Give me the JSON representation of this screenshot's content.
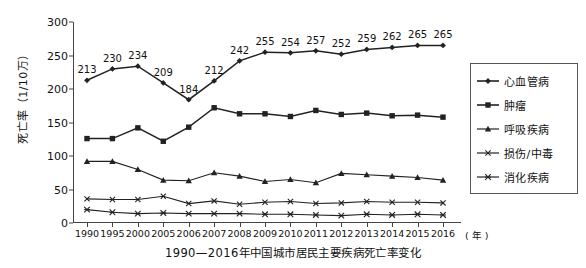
{
  "chart_data": {
    "type": "line",
    "title": "1990—2016年中国城市居民主要疾病死亡率变化",
    "xlabel": "（年）",
    "ylabel": "死亡率（1/10万）",
    "xunit": "( 年 )",
    "ylim": [
      0,
      300
    ],
    "yticks": [
      0,
      50,
      100,
      150,
      200,
      250,
      300
    ],
    "grid": false,
    "legend_position": "right",
    "categories": [
      "1990",
      "1995",
      "2000",
      "2005",
      "2006",
      "2007",
      "2008",
      "2009",
      "2010",
      "2011",
      "2012",
      "2013",
      "2014",
      "2015",
      "2016"
    ],
    "series": [
      {
        "name": "心血管病",
        "marker": "diamond",
        "labeled": true,
        "values": [
          213,
          230,
          234,
          209,
          184,
          212,
          242,
          255,
          254,
          257,
          252,
          259,
          262,
          265,
          265
        ]
      },
      {
        "name": "肿瘤",
        "marker": "square",
        "labeled": false,
        "values": [
          126,
          126,
          142,
          122,
          143,
          172,
          163,
          163,
          159,
          168,
          162,
          164,
          160,
          161,
          158
        ]
      },
      {
        "name": "呼吸疾病",
        "marker": "triangle",
        "labeled": false,
        "values": [
          92,
          92,
          80,
          64,
          63,
          75,
          70,
          62,
          65,
          60,
          74,
          72,
          70,
          68,
          64
        ]
      },
      {
        "name": "损伤/中毒",
        "marker": "x",
        "labeled": false,
        "values": [
          36,
          35,
          35,
          40,
          29,
          33,
          28,
          31,
          32,
          29,
          30,
          32,
          31,
          31,
          30
        ]
      },
      {
        "name": "消化疾病",
        "marker": "asterisk",
        "labeled": false,
        "values": [
          20,
          16,
          14,
          15,
          14,
          14,
          14,
          13,
          13,
          12,
          11,
          13,
          12,
          13,
          12
        ]
      }
    ],
    "value_labels": [
      "213",
      "230",
      "234",
      "209",
      "184",
      "212",
      "242",
      "255",
      "254",
      "257",
      "252",
      "259",
      "262",
      "265",
      "265"
    ]
  }
}
